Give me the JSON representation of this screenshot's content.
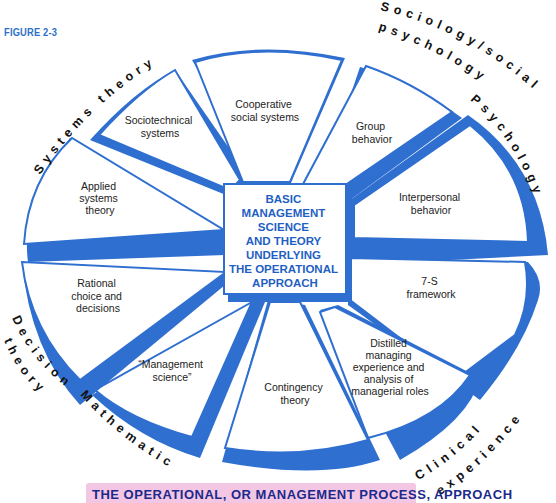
{
  "figure_label": "FIGURE 2-3",
  "center": {
    "lines": [
      "BASIC",
      "MANAGEMENT",
      "SCIENCE",
      "AND THEORY",
      "UNDERLYING",
      "THE OPERATIONAL",
      "APPROACH"
    ]
  },
  "segments": [
    {
      "id": "sociotechnical",
      "lines": [
        "Sociotechnical",
        "systems"
      ]
    },
    {
      "id": "cooperative",
      "lines": [
        "Cooperative",
        "social systems"
      ]
    },
    {
      "id": "group",
      "lines": [
        "Group",
        "behavior"
      ]
    },
    {
      "id": "interpersonal",
      "lines": [
        "Interpersonal",
        "behavior"
      ]
    },
    {
      "id": "seven-s",
      "lines": [
        "7-S",
        "framework"
      ]
    },
    {
      "id": "distilled",
      "lines": [
        "Distilled",
        "managing",
        "experience and",
        "analysis of",
        "managerial roles"
      ]
    },
    {
      "id": "contingency",
      "lines": [
        "Contingency",
        "theory"
      ]
    },
    {
      "id": "management-science",
      "lines": [
        "“Management",
        "science”"
      ]
    },
    {
      "id": "rational",
      "lines": [
        "Rational",
        "choice and",
        "decisions"
      ]
    },
    {
      "id": "applied",
      "lines": [
        "Applied",
        "systems",
        "theory"
      ]
    }
  ],
  "outer_labels": {
    "systems_theory": "Systems theory",
    "sociology": "Sociology/social",
    "sociology_line2": "psychology",
    "psychology": "Psychology",
    "decision": "Decision",
    "decision_line2": "theory",
    "mathematics": "Mathematics",
    "clinical": "Clinical",
    "clinical_line2": "experience"
  },
  "banner": {
    "text": "THE OPERATIONAL, OR MANAGEMENT PROCESS, APPROACH"
  },
  "colors": {
    "blue": "#2f6fd0",
    "banner_bg": "#f3c6e4",
    "banner_text": "#1b2a8a"
  }
}
